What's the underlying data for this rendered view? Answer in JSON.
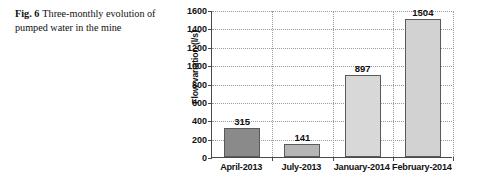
{
  "caption": {
    "figure_label": "Fig. 6",
    "text": "Three-monthly evolution of pumped water in the mine"
  },
  "chart_data": {
    "type": "bar",
    "title": "",
    "xlabel": "",
    "ylabel": "Flow variation (l/s)",
    "categories": [
      "April-2013",
      "July-2013",
      "January-2014",
      "February-2014"
    ],
    "values": [
      315,
      141,
      897,
      1504
    ],
    "value_labels": [
      "315",
      "141",
      "897",
      "1504"
    ],
    "ylim": [
      0,
      1600
    ],
    "yticks": [
      0,
      200,
      400,
      600,
      800,
      1000,
      1200,
      1400,
      1600
    ],
    "ytick_labels": [
      "0",
      "200",
      "400",
      "600",
      "800",
      "1000",
      "1200",
      "1400",
      "1600"
    ],
    "grid": "horizontal-and-vertical-dotted",
    "legend": "none",
    "bar_colors": [
      "#8a8a8a",
      "#b5b5b5",
      "#d8d8d8",
      "#d2d2d2"
    ],
    "bar_border_color": "#5a5a5a"
  }
}
